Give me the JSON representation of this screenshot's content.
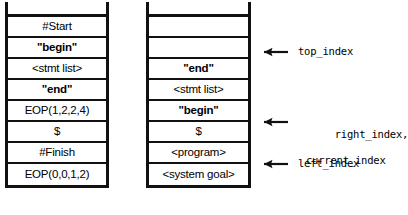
{
  "diagram": {
    "type": "parser-stack-snapshot",
    "stacks": [
      {
        "name": "left-stack",
        "cells": [
          {
            "text": "#Start",
            "bold": false,
            "empty": false
          },
          {
            "text": "\"begin\"",
            "bold": true,
            "empty": false
          },
          {
            "text": "<stmt list>",
            "bold": false,
            "empty": false
          },
          {
            "text": "\"end\"",
            "bold": true,
            "empty": false
          },
          {
            "text": "EOP(1,2,2,4)",
            "bold": false,
            "empty": false
          },
          {
            "text": "$",
            "bold": false,
            "empty": false
          },
          {
            "text": "#Finish",
            "bold": false,
            "empty": false
          },
          {
            "text": "EOP(0,0,1,2)",
            "bold": false,
            "empty": false
          }
        ]
      },
      {
        "name": "right-stack",
        "cells": [
          {
            "text": "",
            "bold": false,
            "empty": true
          },
          {
            "text": "",
            "bold": false,
            "empty": true
          },
          {
            "text": "\"end\"",
            "bold": true,
            "empty": false
          },
          {
            "text": "<stmt list>",
            "bold": false,
            "empty": false
          },
          {
            "text": "\"begin\"",
            "bold": true,
            "empty": false
          },
          {
            "text": "$",
            "bold": false,
            "empty": false
          },
          {
            "text": "<program>",
            "bold": false,
            "empty": false
          },
          {
            "text": "<system goal>",
            "bold": false,
            "empty": false
          }
        ]
      }
    ],
    "annotations": [
      {
        "name": "top-index",
        "line1": "top_index",
        "line2": "",
        "target_row": 1
      },
      {
        "name": "right-index",
        "line1": "right_index,",
        "line2": "current_index",
        "target_row": 4
      },
      {
        "name": "left-index",
        "line1": "left_index",
        "line2": "",
        "target_row": 6
      }
    ]
  }
}
